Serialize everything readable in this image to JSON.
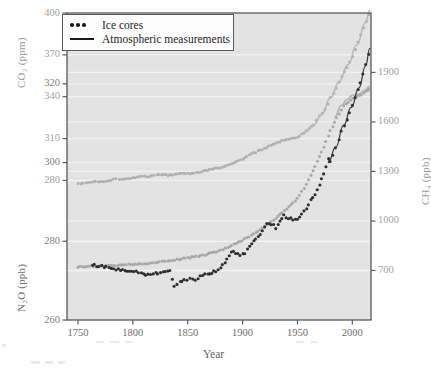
{
  "figure": {
    "background_color": "#ffffff",
    "plot_background_color": "#e3e3e3",
    "plot_border_color": "#5a5a5a",
    "gridline_color": "#f2f2f2"
  },
  "legend": {
    "position": "top-left-inside",
    "entries": [
      {
        "label": "Ice cores",
        "marker": "dots",
        "color": "#1c1c1c"
      },
      {
        "label": "Atmospheric measurements",
        "marker": "line",
        "color": "#1c1c1c"
      }
    ]
  },
  "axes": {
    "x": {
      "label": "Year",
      "ticks": [
        1750,
        1800,
        1850,
        1900,
        1950,
        2000
      ],
      "tick_labels": [
        "1750",
        "1800",
        "1850",
        "1900",
        "1950",
        "2000"
      ],
      "range": [
        1740,
        2017
      ],
      "color": "#6e6e6e"
    },
    "co2": {
      "label": "CO₂ (ppm)",
      "ticks": [
        280,
        310,
        340,
        370,
        400
      ],
      "tick_labels": [
        "280",
        "310",
        "340",
        "370",
        "400"
      ],
      "range": [
        180,
        400
      ],
      "side": "left",
      "color": "#9a9a9a"
    },
    "ch4": {
      "label": "CH₄ (ppb)",
      "ticks": [
        700,
        1000,
        1300,
        1600,
        1900
      ],
      "tick_labels": [
        "700",
        "1000",
        "1300",
        "1600",
        "1900"
      ],
      "range": [
        400,
        2260
      ],
      "side": "right",
      "color": "#9a9a9a"
    },
    "n2o": {
      "label": "N₂O (ppb)",
      "ticks": [
        260,
        280,
        300,
        320
      ],
      "tick_labels": [
        "260",
        "280",
        "300",
        "320"
      ],
      "range": [
        260,
        338
      ],
      "side": "left",
      "color": "#7d7d7d"
    }
  },
  "chart_data": {
    "type": "scatter",
    "title": "",
    "subtitle": "",
    "xlabel": "Year",
    "ylabel": "CO₂ (ppm) / CH₄ (ppb) / N₂O (ppb)",
    "grid": true,
    "legend_position": "top-left",
    "xlim": [
      1740,
      2017
    ],
    "series": [
      {
        "name": "CO₂",
        "unit": "ppm",
        "axis": "co2",
        "axis_side": "left",
        "color": "#b0b0b0",
        "marker": "dot",
        "ylim": [
          180,
          400
        ],
        "x": [
          1750,
          1755,
          1762,
          1770,
          1778,
          1785,
          1792,
          1800,
          1808,
          1815,
          1822,
          1830,
          1836,
          1842,
          1848,
          1854,
          1860,
          1866,
          1872,
          1878,
          1884,
          1890,
          1896,
          1902,
          1908,
          1914,
          1920,
          1926,
          1932,
          1938,
          1944,
          1950,
          1956,
          1960,
          1965,
          1970,
          1975,
          1980,
          1985,
          1990,
          1995,
          2000,
          2005,
          2010,
          2015
        ],
        "y": [
          278,
          278,
          279,
          279,
          280,
          281,
          281,
          282,
          283,
          283,
          284,
          284,
          284,
          285,
          285,
          285,
          286,
          287,
          288,
          289,
          290,
          292,
          294,
          296,
          299,
          301,
          303,
          305,
          307,
          309,
          310,
          311,
          314,
          317,
          320,
          326,
          331,
          339,
          346,
          354,
          361,
          369,
          379,
          389,
          399
        ]
      },
      {
        "name": "CH₄",
        "unit": "ppb",
        "axis": "ch4",
        "axis_side": "right",
        "color": "#a8a8a8",
        "marker": "dot",
        "ylim": [
          400,
          2260
        ],
        "x": [
          1750,
          1758,
          1766,
          1774,
          1782,
          1790,
          1798,
          1806,
          1814,
          1822,
          1830,
          1838,
          1846,
          1854,
          1862,
          1870,
          1878,
          1886,
          1894,
          1902,
          1910,
          1918,
          1926,
          1934,
          1942,
          1950,
          1956,
          1962,
          1968,
          1972,
          1976,
          1980,
          1984,
          1988,
          1992,
          1996,
          2000,
          2004,
          2008,
          2012,
          2015
        ],
        "y": [
          722,
          724,
          726,
          728,
          731,
          734,
          737,
          740,
          744,
          750,
          757,
          764,
          772,
          781,
          790,
          802,
          818,
          840,
          865,
          890,
          920,
          955,
          995,
          1040,
          1085,
          1135,
          1200,
          1275,
          1360,
          1420,
          1480,
          1545,
          1600,
          1650,
          1695,
          1720,
          1745,
          1755,
          1765,
          1785,
          1800
        ]
      },
      {
        "name": "N₂O",
        "unit": "ppb",
        "axis": "n2o",
        "axis_side": "left",
        "color": "#2e2e2e",
        "marker": "dot",
        "ylim": [
          260,
          338
        ],
        "x": [
          1763,
          1795,
          1799,
          1814,
          1834,
          1838,
          1843,
          1847,
          1852,
          1857,
          1864,
          1868,
          1872,
          1876,
          1882,
          1886,
          1890,
          1894,
          1898,
          1902,
          1906,
          1910,
          1914,
          1918,
          1922,
          1926,
          1930,
          1934,
          1938,
          1942,
          1946,
          1950,
          1954,
          1958,
          1962,
          1966,
          1970,
          1974,
          1978,
          1980,
          1985,
          1990,
          1995,
          2000,
          2005,
          2010,
          2015
        ],
        "y": [
          274,
          272.5,
          272.5,
          271.5,
          272.5,
          268.5,
          270,
          270,
          270.5,
          270,
          271.5,
          272,
          272,
          272.5,
          274,
          275.5,
          277.5,
          277,
          276.5,
          277,
          279,
          280,
          281,
          282.5,
          284.5,
          284.5,
          283.5,
          285,
          286.5,
          286,
          285.5,
          285.5,
          287,
          288.5,
          290.5,
          292,
          294.5,
          297,
          301,
          300,
          303.5,
          308,
          311,
          314.5,
          318.5,
          322.5,
          327.5
        ]
      }
    ],
    "line_segments": [
      {
        "name": "CO₂ atmospheric measurements",
        "axis": "co2",
        "color": "#b8b8b8",
        "x": [
          1958,
          1965,
          1972,
          1980,
          1988,
          1996,
          2004,
          2012,
          2016
        ],
        "y": [
          315,
          320,
          327,
          339,
          351,
          363,
          377,
          393,
          402
        ]
      },
      {
        "name": "CH₄ atmospheric measurements",
        "axis": "ch4",
        "color": "#b0b0b0",
        "x": [
          1984,
          1990,
          1995,
          2000,
          2006,
          2011,
          2016
        ],
        "y": [
          1630,
          1700,
          1735,
          1760,
          1770,
          1790,
          1815
        ]
      },
      {
        "name": "N₂O atmospheric measurements",
        "axis": "n2o",
        "color": "#3a3a3a",
        "x": [
          1978,
          1985,
          1992,
          1999,
          2006,
          2012,
          2016
        ],
        "y": [
          300,
          304,
          309.5,
          314,
          319,
          324.5,
          329
        ]
      }
    ]
  }
}
